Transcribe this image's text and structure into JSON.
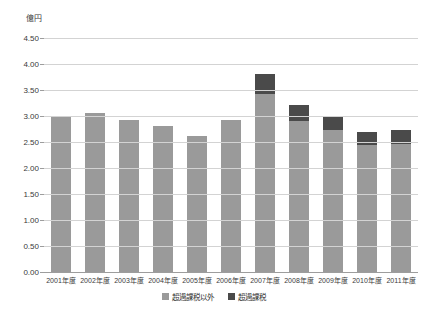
{
  "chart_data": {
    "type": "bar",
    "subtype": "stacked-vertical",
    "title": "",
    "unit_label": "億円",
    "xlabel": "",
    "ylabel": "",
    "ylim": [
      0.0,
      4.5
    ],
    "ytick_step": 0.5,
    "grid": true,
    "legend_position": "bottom-center",
    "categories": [
      "2001年度",
      "2002年度",
      "2003年度",
      "2004年度",
      "2005年度",
      "2006年度",
      "2007年度",
      "2008年度",
      "2009年度",
      "2010年度",
      "2011年度"
    ],
    "ytick_labels": [
      "4.50",
      "4.00",
      "3.50",
      "3.00",
      "2.50",
      "2.00",
      "1.50",
      "1.00",
      "0.50",
      "0.00"
    ],
    "series": [
      {
        "name": "超過課税以外",
        "color": "#9a9a9a",
        "values": [
          3.0,
          3.05,
          2.93,
          2.8,
          2.62,
          2.92,
          3.42,
          2.9,
          2.73,
          2.45,
          2.47
        ]
      },
      {
        "name": "超過課税",
        "color": "#4a4a4a",
        "values": [
          0.0,
          0.0,
          0.0,
          0.0,
          0.0,
          0.0,
          0.38,
          0.32,
          0.25,
          0.25,
          0.26
        ]
      }
    ],
    "totals": [
      3.0,
      3.05,
      2.93,
      2.8,
      2.62,
      2.92,
      3.8,
      3.22,
      2.98,
      2.7,
      2.73
    ]
  },
  "legend": {
    "items": [
      {
        "label": "超過課税以外",
        "color": "#9a9a9a"
      },
      {
        "label": "超過課税",
        "color": "#4a4a4a"
      }
    ]
  },
  "colors": {
    "primary": "#9a9a9a",
    "secondary": "#4a4a4a",
    "gridline": "#d3d3d3",
    "axis": "#9d9d9d",
    "text": "#3a3a3a",
    "background": "#ffffff"
  }
}
